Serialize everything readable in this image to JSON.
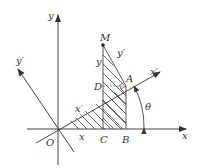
{
  "figure": {
    "type": "coordinate rotation diagram",
    "labels": {
      "y_axis": "y",
      "x_axis": "x",
      "y_prime_axis": "y′",
      "x_prime_axis": "x′",
      "origin": "O",
      "point_M": "M",
      "point_A": "A",
      "point_D": "D",
      "point_C": "C",
      "point_B": "B",
      "angle": "θ",
      "segment_x": "x",
      "segment_y": "y",
      "segment_x_prime": "x′",
      "segment_y_prime": "y′"
    },
    "colors": {
      "line": "#333333",
      "axis": "#444444"
    }
  }
}
